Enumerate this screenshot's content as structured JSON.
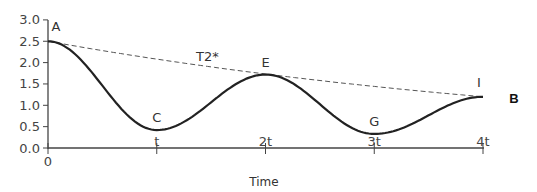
{
  "chart_data": {
    "type": "line",
    "title": "",
    "panel_label": "B",
    "xlabel": "Time",
    "ylabel": "",
    "ylim": [
      0,
      3.0
    ],
    "yticks": [
      "0.0",
      "0.5",
      "1.0",
      "1.5",
      "2.0",
      "2.5",
      "3.0"
    ],
    "xticks": [
      "0",
      "t",
      "2t",
      "3t",
      "4t"
    ],
    "grid": false,
    "legend": "none",
    "series": [
      {
        "name": "signal",
        "style": "solid",
        "x": [
          0,
          1,
          2,
          3,
          4
        ],
        "x_labels": [
          "0",
          "t",
          "2t",
          "3t",
          "4t"
        ],
        "values": [
          2.5,
          0.42,
          1.72,
          0.33,
          1.2
        ],
        "point_labels": [
          "A",
          "C",
          "E",
          "G",
          "I"
        ]
      },
      {
        "name": "T2* decay envelope",
        "label": "T2*",
        "style": "dashed",
        "x": [
          0,
          4
        ],
        "values": [
          2.5,
          1.2
        ]
      }
    ],
    "annotations": [
      "A",
      "C",
      "E",
      "G",
      "I",
      "T2*"
    ]
  }
}
